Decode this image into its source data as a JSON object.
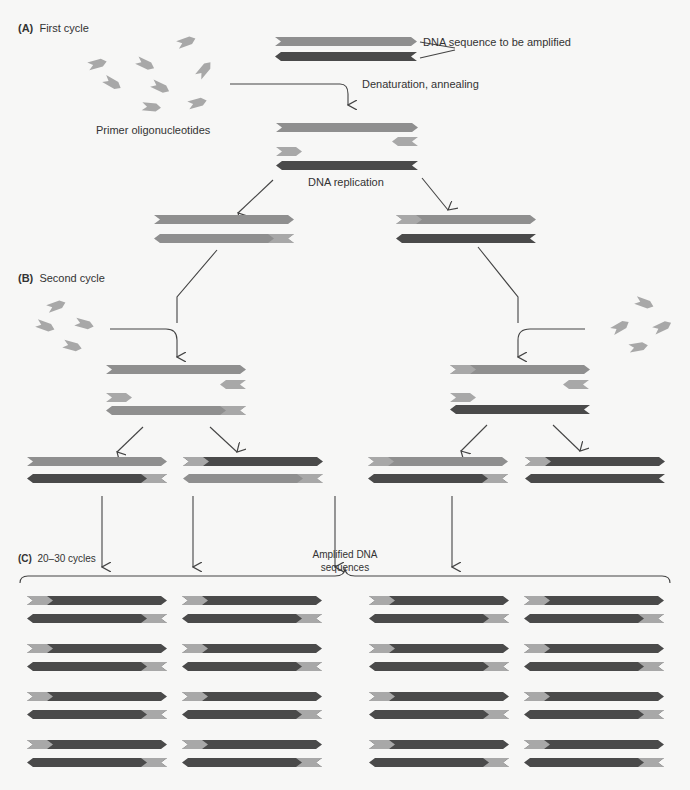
{
  "colors": {
    "background": "#f7f7f6",
    "strand_light": "#8f8f8f",
    "strand_dark": "#4a4a4a",
    "primer": "#a8a8a8",
    "line": "#444444"
  },
  "sections": {
    "A": {
      "tag": "(A)",
      "title": "First cycle"
    },
    "B": {
      "tag": "(B)",
      "title": "Second cycle"
    },
    "C": {
      "tag": "(C)",
      "title": "20–30 cycles"
    }
  },
  "labels": {
    "dna_target": "DNA sequence to be amplified",
    "denaturation": "Denaturation, annealing",
    "primers": "Primer oligonucleotides",
    "replication": "DNA replication",
    "amplified_line1": "Amplified DNA",
    "amplified_line2": "sequences"
  }
}
